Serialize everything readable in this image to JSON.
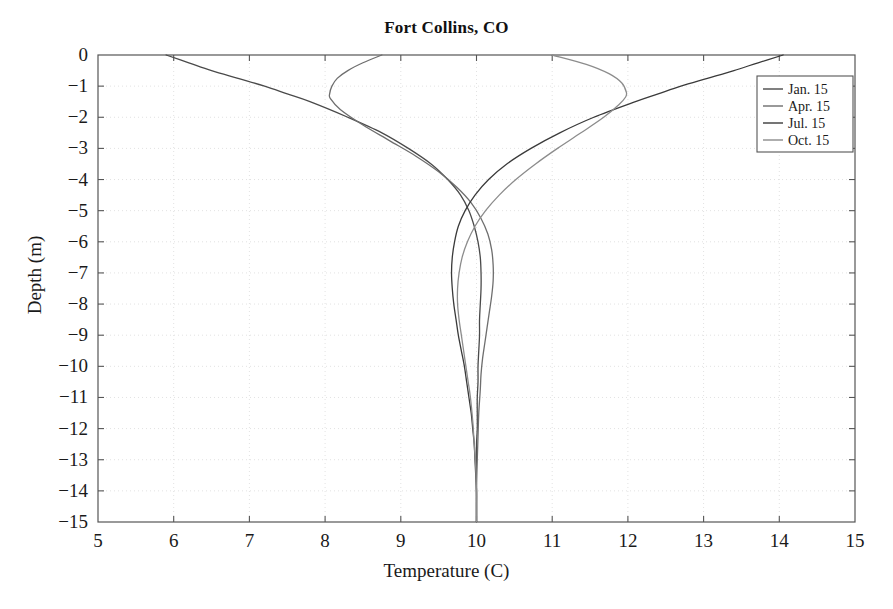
{
  "chart_data": {
    "type": "line",
    "title": "Fort Collins, CO",
    "xlabel": "Temperature (C)",
    "ylabel": "Depth (m)",
    "xlim": [
      5,
      15
    ],
    "ylim": [
      -15,
      0
    ],
    "xticks": [
      "5",
      "6",
      "7",
      "8",
      "9",
      "10",
      "11",
      "12",
      "13",
      "14",
      "15"
    ],
    "yticks": [
      "0",
      "-1",
      "-2",
      "-3",
      "-4",
      "-5",
      "-6",
      "-7",
      "-8",
      "-9",
      "-10",
      "-11",
      "-12",
      "-13",
      "-14",
      "-15"
    ],
    "grid": true,
    "grid_style": "dotted",
    "legend_position": "upper right",
    "series": [
      {
        "name": "Jan. 15",
        "color": "#4a4a4a",
        "depth": [
          0,
          -0.25,
          -0.5,
          -0.75,
          -1,
          -1.25,
          -1.5,
          -2,
          -2.5,
          -3,
          -3.5,
          -4,
          -4.5,
          -5,
          -5.5,
          -6,
          -6.5,
          -7,
          -7.5,
          -8,
          -8.5,
          -9,
          -9.5,
          -10,
          -10.5,
          -11,
          -11.5,
          -12,
          -12.5,
          -13,
          -13.5,
          -14,
          -14.5,
          -15
        ],
        "temperature": [
          5.9,
          6.2,
          6.5,
          6.85,
          7.2,
          7.5,
          7.8,
          8.3,
          8.75,
          9.1,
          9.4,
          9.62,
          9.79,
          9.9,
          9.97,
          10.02,
          10.05,
          10.06,
          10.06,
          10.05,
          10.04,
          10.04,
          10.03,
          10.02,
          10.02,
          10.01,
          10.01,
          10.01,
          10.0,
          10.0,
          10.0,
          10.0,
          10.0,
          10.0
        ]
      },
      {
        "name": "Apr. 15",
        "color": "#6e6e6e",
        "depth": [
          0,
          -0.25,
          -0.5,
          -0.75,
          -1,
          -1.25,
          -1.4,
          -1.75,
          -2.25,
          -2.75,
          -3.25,
          -3.75,
          -4.25,
          -4.75,
          -5.25,
          -5.75,
          -6.25,
          -6.75,
          -7.25,
          -7.75,
          -8.25,
          -8.75,
          -9.25,
          -9.75,
          -10.25,
          -10.75,
          -11.5,
          -12.25,
          -13,
          -13.75,
          -14.5,
          -15
        ],
        "temperature": [
          8.75,
          8.5,
          8.3,
          8.16,
          8.09,
          8.06,
          8.07,
          8.2,
          8.5,
          8.85,
          9.2,
          9.5,
          9.74,
          9.93,
          10.06,
          10.15,
          10.2,
          10.22,
          10.22,
          10.2,
          10.17,
          10.14,
          10.11,
          10.08,
          10.06,
          10.05,
          10.03,
          10.02,
          10.01,
          10.0,
          10.0,
          10.0
        ]
      },
      {
        "name": "Jul. 15",
        "color": "#3a3a3a",
        "depth": [
          0,
          -0.25,
          -0.5,
          -0.75,
          -1,
          -1.25,
          -1.5,
          -2,
          -2.5,
          -3,
          -3.5,
          -4,
          -4.5,
          -5,
          -5.5,
          -6,
          -6.5,
          -7,
          -7.5,
          -8,
          -8.5,
          -9,
          -9.5,
          -10,
          -10.5,
          -11,
          -11.5,
          -12,
          -12.5,
          -13,
          -13.5,
          -14,
          -14.5,
          -15
        ],
        "temperature": [
          14.05,
          13.72,
          13.4,
          13.05,
          12.7,
          12.4,
          12.1,
          11.55,
          11.1,
          10.72,
          10.4,
          10.16,
          9.98,
          9.85,
          9.76,
          9.71,
          9.68,
          9.67,
          9.68,
          9.7,
          9.73,
          9.76,
          9.8,
          9.84,
          9.87,
          9.9,
          9.93,
          9.95,
          9.97,
          9.98,
          9.99,
          10.0,
          10.0,
          10.0
        ]
      },
      {
        "name": "Oct. 15",
        "color": "#8c8c8c",
        "depth": [
          0,
          -0.3,
          -0.6,
          -0.9,
          -1.2,
          -1.35,
          -1.6,
          -2,
          -2.5,
          -3,
          -3.5,
          -4,
          -4.5,
          -5,
          -5.5,
          -6,
          -6.5,
          -7,
          -7.5,
          -8,
          -8.5,
          -9,
          -9.5,
          -10,
          -10.5,
          -11,
          -11.75,
          -12.5,
          -13.25,
          -14,
          -14.5,
          -15
        ],
        "temperature": [
          11.0,
          11.45,
          11.75,
          11.92,
          11.98,
          11.97,
          11.88,
          11.68,
          11.38,
          11.07,
          10.78,
          10.52,
          10.3,
          10.12,
          9.98,
          9.88,
          9.81,
          9.77,
          9.75,
          9.75,
          9.77,
          9.8,
          9.83,
          9.86,
          9.89,
          9.92,
          9.95,
          9.97,
          9.99,
          10.0,
          10.0,
          10.0
        ]
      }
    ]
  },
  "axes": {
    "frame_color": "#555555",
    "grid_color": "#e2e2e2",
    "background": "#ffffff"
  }
}
